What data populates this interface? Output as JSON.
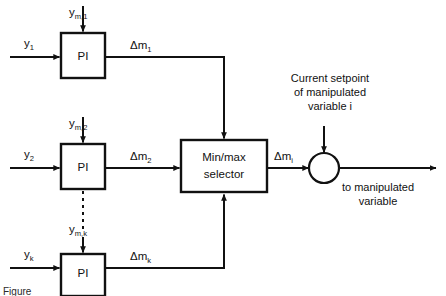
{
  "figure": {
    "caption": "Figure",
    "background_color": "#ffffff",
    "line_color": "#111111"
  },
  "controllers": [
    {
      "id": "pi-1",
      "block_label": "PI",
      "process_input": "y",
      "process_input_sub": "1",
      "measurement_input": "y",
      "measurement_input_sub": "m,1",
      "output": "Δm",
      "output_sub": "1"
    },
    {
      "id": "pi-2",
      "block_label": "PI",
      "process_input": "y",
      "process_input_sub": "2",
      "measurement_input": "y",
      "measurement_input_sub": "m,2",
      "output": "Δm",
      "output_sub": "2"
    },
    {
      "id": "pi-k",
      "block_label": "PI",
      "process_input": "y",
      "process_input_sub": "k",
      "measurement_input": "y",
      "measurement_input_sub": "m,k",
      "output": "Δm",
      "output_sub": "k"
    }
  ],
  "selector": {
    "label_line_1": "Min/max",
    "label_line_2": "selector",
    "output": "Δm",
    "output_sub": "i"
  },
  "summing_junction": {
    "name": "summing-junction",
    "setpoint_note_line_1": "Current setpoint",
    "setpoint_note_line_2": "of manipulated",
    "setpoint_note_line_3": "variable i",
    "output_note_line_1": "to manipulated",
    "output_note_line_2": "variable"
  },
  "continuation": {
    "vertical_ellipsis": "⋮"
  }
}
